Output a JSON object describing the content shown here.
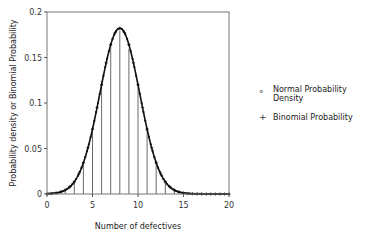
{
  "chart_data": {
    "type": "line",
    "title": "",
    "xlabel": "Number of defectives",
    "ylabel": "Probability density or Binomial Probability",
    "xlim": [
      0,
      20
    ],
    "ylim": [
      0,
      0.2
    ],
    "xticks": [
      0,
      5,
      10,
      15,
      20
    ],
    "yticks": [
      0,
      0.05,
      0.1,
      0.15,
      0.2
    ],
    "ytick_labels": [
      "0",
      "0.05",
      "0.1",
      "0.15",
      "0.2"
    ],
    "grid": false,
    "legend_position": "right",
    "series": [
      {
        "name": "Normal Probability Density",
        "marker": "dot",
        "mean": 8,
        "sd": 2.19,
        "x": [
          0,
          0.5,
          1,
          1.5,
          2,
          2.5,
          3,
          3.5,
          4,
          4.5,
          5,
          5.5,
          6,
          6.5,
          7,
          7.5,
          8,
          8.5,
          9,
          9.5,
          10,
          10.5,
          11,
          11.5,
          12,
          12.5,
          13,
          13.5,
          14,
          14.5,
          15,
          15.5,
          16,
          16.5,
          17,
          17.5,
          18,
          18.5,
          19,
          19.5,
          20
        ],
        "values": [
          0.0002,
          0.0004,
          0.0011,
          0.0027,
          0.006,
          0.0123,
          0.0227,
          0.0383,
          0.0591,
          0.0836,
          0.1083,
          0.1286,
          0.1399,
          0.1396,
          0.162,
          0.1775,
          0.1821,
          0.1775,
          0.162,
          0.1396,
          0.1199,
          0.0992,
          0.0713,
          0.051,
          0.034,
          0.0201,
          0.0108,
          0.0053,
          0.0024,
          0.001,
          0.0004,
          0.0001,
          0.0,
          0.0,
          0.0,
          0.0,
          0.0,
          0.0,
          0.0,
          0.0,
          0.0
        ]
      },
      {
        "name": "Binomial Probability",
        "marker": "plus",
        "n": 20,
        "p": 0.4,
        "x": [
          0,
          1,
          2,
          3,
          4,
          5,
          6,
          7,
          8,
          9,
          10,
          11,
          12,
          13,
          14,
          15,
          16,
          17,
          18,
          19,
          20
        ],
        "values": [
          0.0,
          0.0005,
          0.0031,
          0.0123,
          0.035,
          0.0746,
          0.1244,
          0.1659,
          0.1797,
          0.1597,
          0.1171,
          0.071,
          0.0355,
          0.0146,
          0.0049,
          0.0013,
          0.0003,
          0.0,
          0.0,
          0.0,
          0.0
        ]
      }
    ]
  },
  "legend": {
    "items": [
      {
        "marker": "°",
        "label": "Normal Probability Density"
      },
      {
        "marker": "+",
        "label": "Binomial Probability"
      }
    ]
  }
}
